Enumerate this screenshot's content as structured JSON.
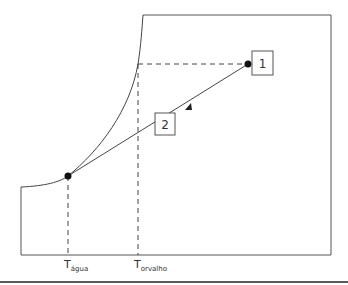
{
  "diagram": {
    "points": [
      {
        "id": "1",
        "label": "1"
      },
      {
        "id": "2",
        "label": "2"
      }
    ],
    "axis_labels": {
      "t_agua": {
        "main": "T",
        "sub": "água"
      },
      "t_orvalho": {
        "main": "T",
        "sub": "orvalho"
      }
    },
    "colors": {
      "line": "#333333",
      "background": "#ffffff"
    }
  }
}
